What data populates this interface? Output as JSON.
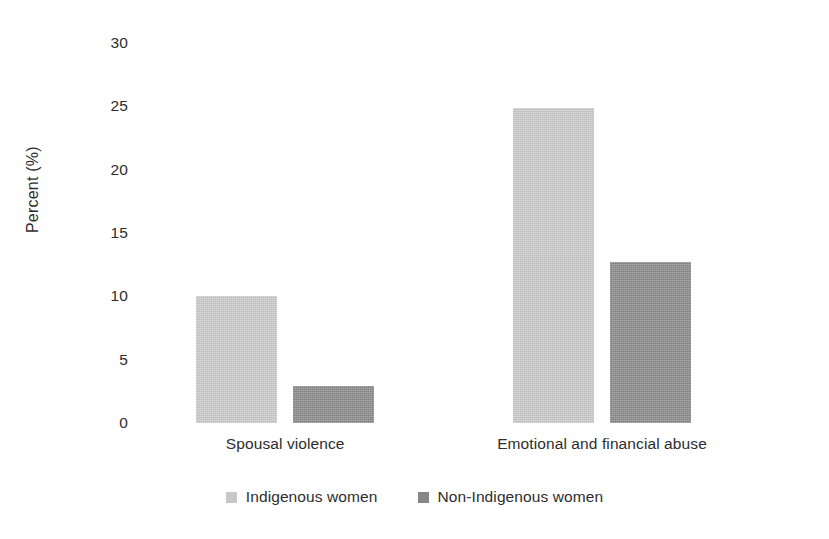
{
  "chart_data": {
    "type": "bar",
    "title": "",
    "subtitle": "",
    "xlabel": "",
    "ylabel": "Percent (%)",
    "ylim": [
      0,
      30
    ],
    "yticks": [
      0,
      5,
      10,
      15,
      20,
      25,
      30
    ],
    "ytick_labels": [
      "0",
      "5",
      "10",
      "15",
      "20",
      "25",
      "30"
    ],
    "grid": false,
    "legend_position": "bottom-center",
    "categories": [
      "Spousal violence",
      "Emotional and financial abuse"
    ],
    "series": [
      {
        "name": "Indigenous women",
        "color": "#c8c8c8",
        "values": [
          10.0,
          24.9
        ]
      },
      {
        "name": "Non-Indigenous women",
        "color": "#878787",
        "values": [
          2.9,
          12.7
        ]
      }
    ]
  },
  "legend": {
    "items": [
      {
        "label": "Indigenous women",
        "swatch": "light"
      },
      {
        "label": "Non-Indigenous women",
        "swatch": "dark"
      }
    ]
  },
  "colors": {
    "background": "#ffffff",
    "text": "#2d2d2d",
    "series_light": "#c8c8c8",
    "series_dark": "#878787"
  }
}
